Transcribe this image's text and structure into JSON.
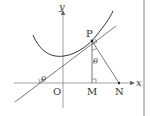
{
  "diagram": {
    "axes": {
      "x_label": "x",
      "y_label": "y",
      "origin_label": "O"
    },
    "points": {
      "P": "P",
      "M": "M",
      "N": "N"
    },
    "angles": {
      "at_tangent_intercept": "θ",
      "at_P": "θ"
    },
    "colors": {
      "stroke": "#555555",
      "curve": "#333333",
      "text": "#333333"
    }
  }
}
